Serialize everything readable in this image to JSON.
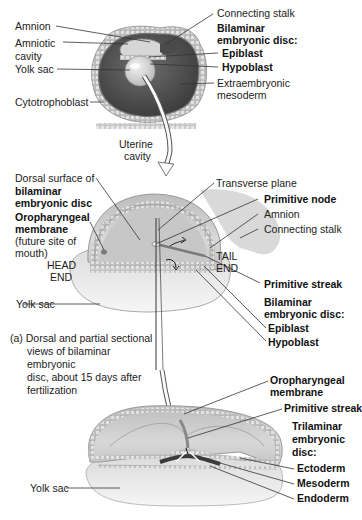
{
  "figure": {
    "panel_a": {
      "blastocyst_view": {
        "left_labels": [
          "Amnion",
          "Amniotic cavity",
          "Yolk sac",
          "Cytotrophoblast"
        ],
        "right_labels": {
          "connecting_stalk": "Connecting stalk",
          "group_title_1": "Bilaminar",
          "group_title_2": "embryonic disc:",
          "epiblast": "Epiblast",
          "hypoblast": "Hypoblast",
          "extraembryonic_1": "Extraembryonic",
          "extraembryonic_2": "mesoderm"
        },
        "arrow_label_1": "Uterine",
        "arrow_label_2": "cavity"
      },
      "dorsal_view": {
        "left_labels": {
          "dorsal_1": "Dorsal surface of",
          "dorsal_2": "bilaminar",
          "dorsal_3": "embryonic disc",
          "oro_1": "Oropharyngeal",
          "oro_2": "membrane",
          "oro_3": "(future site of",
          "oro_4": "mouth)",
          "head_1": "HEAD",
          "head_2": "END",
          "yolk_sac": "Yolk sac"
        },
        "right_labels": {
          "transverse_plane": "Transverse plane",
          "primitive_node": "Primitive node",
          "amnion": "Amnion",
          "connecting_stalk": "Connecting stalk",
          "tail_1": "TAIL",
          "tail_2": "END",
          "primitive_streak": "Primitive streak",
          "group_title_1": "Bilaminar",
          "group_title_2": "embryonic disc:",
          "epiblast": "Epiblast",
          "hypoblast": "Hypoblast"
        },
        "caption_1": "(a) Dorsal and partial sectional",
        "caption_2": "views of bilaminar embryonic",
        "caption_3": "disc, about 15 days after",
        "caption_4": "fertilization"
      }
    },
    "panel_b": {
      "left_labels": {
        "yolk_sac": "Yolk sac"
      },
      "right_labels": {
        "oro_1": "Oropharyngeal",
        "oro_2": "membrane",
        "primitive_streak": "Primitive streak",
        "group_title_1": "Trilaminar",
        "group_title_2": "embryonic",
        "group_title_3": "disc:",
        "ectoderm": "Ectoderm",
        "mesoderm": "Mesoderm",
        "endoderm": "Endoderm"
      }
    },
    "colors": {
      "background": "#ffffff",
      "tissue_light": "#d9d9d9",
      "tissue_mid": "#a8a8a8",
      "tissue_dark": "#5a5a5a",
      "leader_line": "#333333"
    }
  }
}
